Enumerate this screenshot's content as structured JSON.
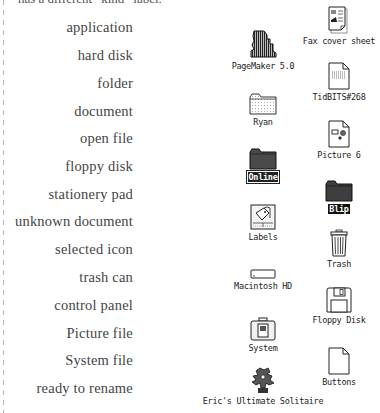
{
  "caption_fragment": "has a different “kind” label.",
  "legend_labels": [
    "application",
    "hard disk",
    "folder",
    "document",
    "open file",
    "floppy disk",
    "stationery pad",
    "unknown document",
    "selected icon",
    "trash can",
    "control panel",
    "Picture file",
    "System file",
    "ready to rename"
  ],
  "icons": {
    "pagemaker": {
      "name": "PageMaker 5.0",
      "icon": "application-icon"
    },
    "ryan": {
      "name": "Ryan",
      "icon": "open-folder-icon"
    },
    "online": {
      "name": "Online",
      "icon": "folder-icon",
      "state": "ready to rename"
    },
    "labels": {
      "name": "Labels",
      "icon": "control-panel-icon"
    },
    "macintosh_hd": {
      "name": "Macintosh HD",
      "icon": "hard-disk-icon"
    },
    "system": {
      "name": "System",
      "icon": "system-file-icon"
    },
    "solitaire": {
      "name": "Eric's Ultimate Solitaire",
      "icon": "application-icon"
    },
    "fax": {
      "name": "Fax cover sheet",
      "icon": "stationery-pad-icon"
    },
    "tidbits": {
      "name": "TidBITS#268",
      "icon": "document-icon"
    },
    "picture6": {
      "name": "Picture 6",
      "icon": "picture-file-icon"
    },
    "blip": {
      "name": "Blip",
      "icon": "folder-icon",
      "state": "selected"
    },
    "trash": {
      "name": "Trash",
      "icon": "trash-can-icon"
    },
    "floppy": {
      "name": "Floppy Disk",
      "icon": "floppy-disk-icon"
    },
    "buttons": {
      "name": "Buttons",
      "icon": "unknown-document-icon"
    }
  }
}
